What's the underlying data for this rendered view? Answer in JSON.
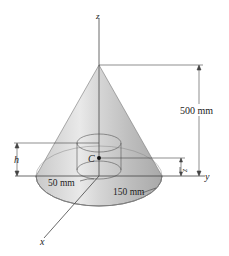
{
  "figure": {
    "axes": {
      "z": "z",
      "y": "y",
      "x": "x"
    },
    "labels": {
      "height": "500 mm",
      "h": "h",
      "centroid": "C",
      "zbar": "z",
      "inner_radius": "50 mm",
      "outer_radius": "150 mm"
    },
    "colors": {
      "cone_light": "#e6e6e6",
      "cone_dark": "#a8a8a8",
      "line": "#444444"
    }
  }
}
